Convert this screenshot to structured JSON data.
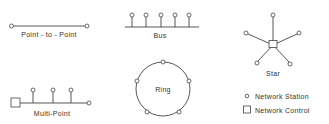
{
  "diagram": {
    "colors": {
      "line": "#444444",
      "text": "#333333",
      "background": "#ffffff"
    },
    "topologies": [
      {
        "id": "point-to-point",
        "label": "Point - to - Point"
      },
      {
        "id": "bus",
        "label": "Bus"
      },
      {
        "id": "star",
        "label": "Star"
      },
      {
        "id": "multi-point",
        "label": "Multi-Point"
      },
      {
        "id": "ring",
        "label": "Ring"
      }
    ],
    "legend": {
      "items": [
        {
          "symbol": "circle",
          "label": "Network Station"
        },
        {
          "symbol": "square",
          "label": "Network Control"
        }
      ]
    }
  }
}
